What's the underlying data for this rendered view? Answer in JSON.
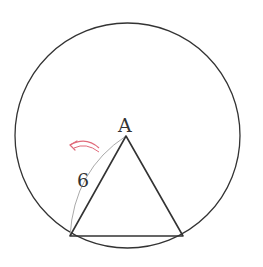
{
  "diagram": {
    "circle": {
      "cx": 127.5,
      "cy": 135.5,
      "r": 112.5,
      "stroke": "#333333"
    },
    "triangle": {
      "apex": {
        "x": 126,
        "y": 136
      },
      "bottom_left": {
        "x": 70,
        "y": 236
      },
      "bottom_right": {
        "x": 183,
        "y": 236
      },
      "stroke": "#333333"
    },
    "vertex_label": "A",
    "arc_length_label": "6",
    "arc_stroke": "#aaaaaa",
    "rotation_arrow_color": "#e06a7a"
  }
}
